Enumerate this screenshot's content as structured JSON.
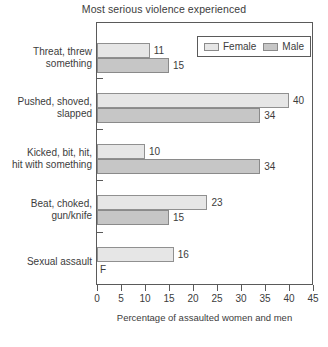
{
  "chart_data": {
    "type": "bar",
    "orientation": "horizontal",
    "title": "Most serious violence experienced",
    "xlabel": "Percentage of assaulted women and men",
    "ylabel": "",
    "xlim": [
      0,
      45
    ],
    "xticks": [
      0,
      5,
      10,
      15,
      20,
      25,
      30,
      35,
      40,
      45
    ],
    "xtick_labels": [
      "0",
      "5",
      "10",
      "15",
      "20",
      "25",
      "30",
      "35",
      "40",
      "45"
    ],
    "grid": false,
    "legend_position": "top-right",
    "categories": [
      "Threat, threw something",
      "Pushed, shoved, slapped",
      "Kicked, bit, hit, hit with something",
      "Beat, choked, gun/knife",
      "Sexual assault"
    ],
    "category_lines": [
      [
        "Threat, threw",
        "something"
      ],
      [
        "Pushed, shoved,",
        "slapped"
      ],
      [
        "Kicked, bit, hit,",
        "hit with something"
      ],
      [
        "Beat, choked,",
        "gun/knife"
      ],
      [
        "Sexual assault"
      ]
    ],
    "series": [
      {
        "name": "Female",
        "color": "#e6e6e6",
        "values": [
          11,
          40,
          10,
          23,
          16
        ],
        "labels": [
          "11",
          "40",
          "10",
          "23",
          "16"
        ]
      },
      {
        "name": "Male",
        "color": "#c6c6c6",
        "values": [
          15,
          34,
          34,
          15,
          null
        ],
        "labels": [
          "15",
          "34",
          "34",
          "15",
          "F"
        ]
      }
    ],
    "suppressed_marker": "F"
  },
  "legend": {
    "items": [
      {
        "label": "Female",
        "swatch": "female-swatch"
      },
      {
        "label": "Male",
        "swatch": "male-swatch"
      }
    ]
  }
}
